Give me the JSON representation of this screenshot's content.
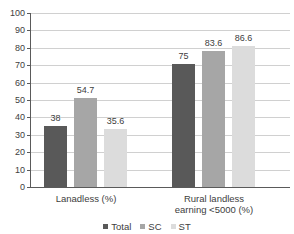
{
  "chart_data": {
    "type": "bar",
    "title": "",
    "xlabel": "",
    "ylabel": "",
    "ylim": [
      0,
      100
    ],
    "yticks": [
      0,
      10,
      20,
      30,
      40,
      50,
      60,
      70,
      80,
      90,
      100
    ],
    "grid": true,
    "legend_position": "bottom",
    "categories": [
      "Lanadless (%)",
      "Rural landless earning <5000 (%)"
    ],
    "category_lines": [
      [
        "Lanadless (%)"
      ],
      [
        "Rural landless",
        "earning <5000 (%)"
      ]
    ],
    "series": [
      {
        "name": "Total",
        "color": "#595959",
        "values": [
          38,
          75
        ],
        "labels": [
          "38",
          "75"
        ],
        "plotted": [
          35.2,
          70.5
        ]
      },
      {
        "name": "SC",
        "color": "#a6a6a6",
        "values": [
          54.7,
          83.6
        ],
        "labels": [
          "54.7",
          "83.6"
        ],
        "plotted": [
          51.3,
          78.4
        ]
      },
      {
        "name": "ST",
        "color": "#dcdcdc",
        "values": [
          35.6,
          86.6
        ],
        "labels": [
          "35.6",
          "86.6"
        ],
        "plotted": [
          33.2,
          81.2
        ]
      }
    ]
  },
  "axis": {
    "tick_labels": [
      "100",
      "90",
      "80",
      "70",
      "60",
      "50",
      "40",
      "30",
      "20",
      "10",
      "0"
    ]
  },
  "legend": {
    "items": [
      {
        "label": "Total",
        "color": "#595959"
      },
      {
        "label": "SC",
        "color": "#a6a6a6"
      },
      {
        "label": "ST",
        "color": "#dcdcdc"
      }
    ]
  },
  "colors": {
    "total": "#595959",
    "sc": "#a6a6a6",
    "st": "#dcdcdc",
    "grid": "#d0d0d0",
    "axis": "#5a5a5a",
    "text": "#404040"
  }
}
